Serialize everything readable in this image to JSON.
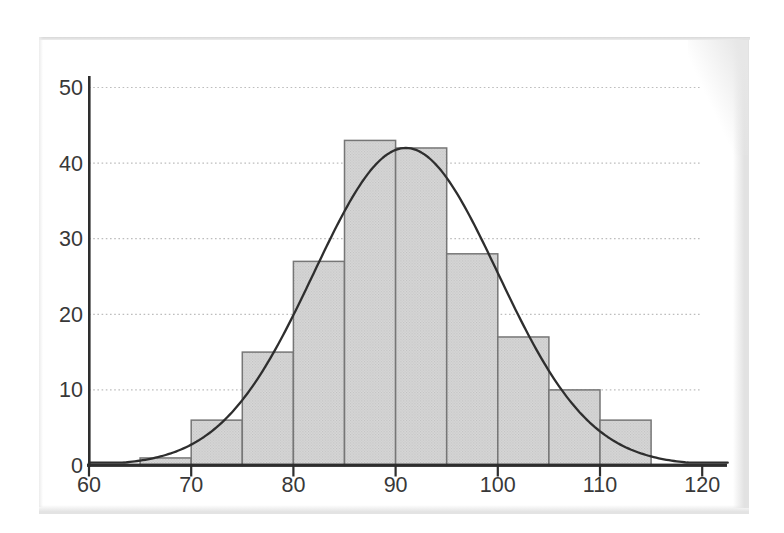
{
  "chart_data": {
    "type": "bar",
    "subtype": "histogram-with-normal-curve",
    "title": "",
    "xlabel": "",
    "ylabel": "",
    "x_ticks": [
      60,
      70,
      80,
      90,
      100,
      110,
      120
    ],
    "y_ticks": [
      0,
      10,
      20,
      30,
      40,
      50
    ],
    "xlim": [
      60,
      122.5
    ],
    "ylim": [
      0,
      52
    ],
    "grid": "horizontal-dotted",
    "legend": "none",
    "bin_width": 5,
    "bin_starts": [
      65,
      70,
      75,
      80,
      85,
      90,
      95,
      100,
      105,
      110
    ],
    "counts": [
      1,
      6,
      15,
      27,
      43,
      42,
      28,
      17,
      10,
      6
    ],
    "normal_curve": {
      "mean": 91,
      "sd": 9,
      "peak_height": 42
    },
    "colors": {
      "background": "#ffffff",
      "bar_fill": "#d9d9d9",
      "bar_halftone_dot": "#bfbfbf",
      "bar_border": "#767676",
      "curve": "#2e2e2e",
      "axis": "#2e2e2e",
      "gridline": "#bdbdbd",
      "label": "#383838",
      "scan_edge": "#e3e3e3"
    }
  }
}
